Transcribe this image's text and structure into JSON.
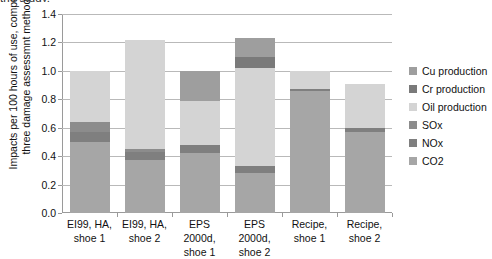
{
  "top_caption": "the study.",
  "chart_data": {
    "type": "bar",
    "subtype": "stacked",
    "title": "",
    "xlabel": "",
    "ylabel": "Impacts per 100 hours of use, comparing three damage assessmnt methods",
    "ylabel_lines": [
      "Impacts per 100 hours of use, comparing",
      "three damage assessmnt methods"
    ],
    "ylim": [
      0.0,
      1.4
    ],
    "yticks": [
      0.0,
      0.2,
      0.4,
      0.6,
      0.8,
      1.0,
      1.2,
      1.4
    ],
    "ytick_labels": [
      "0.0",
      "0.2",
      "0.4",
      "0.6",
      "0.8",
      "1.0",
      "1.2",
      "1.4"
    ],
    "grid": true,
    "legend_position": "right",
    "categories": [
      "EI99, HA, shoe 1",
      "EI99, HA, shoe 2",
      "EPS 2000d, shoe 1",
      "EPS 2000d, shoe 2",
      "Recipe, shoe 1",
      "Recipe, shoe 2"
    ],
    "category_lines": [
      [
        "EI99, HA,",
        "shoe 1"
      ],
      [
        "EI99, HA,",
        "shoe 2"
      ],
      [
        "EPS 2000d,",
        "shoe 1"
      ],
      [
        "EPS 2000d,",
        "shoe 2"
      ],
      [
        "Recipe,",
        "shoe 1"
      ],
      [
        "Recipe,",
        "shoe 2"
      ]
    ],
    "stack_order_bottom_to_top": [
      "CO2",
      "NOx",
      "SOx",
      "Oil production",
      "Cr production",
      "Cu production"
    ],
    "series": [
      {
        "name": "CO2",
        "color": "#a6a6a6",
        "values": [
          0.5,
          0.37,
          0.42,
          0.28,
          0.855,
          0.57
        ]
      },
      {
        "name": "NOx",
        "color": "#7f7f7f",
        "values": [
          0.07,
          0.06,
          0.06,
          0.05,
          0.02,
          0.03
        ]
      },
      {
        "name": "SOx",
        "color": "#8c8c8c",
        "values": [
          0.07,
          0.02,
          0.0,
          0.0,
          0.0,
          0.0
        ]
      },
      {
        "name": "Oil production",
        "color": "#d4d4d4",
        "values": [
          0.36,
          0.77,
          0.31,
          0.69,
          0.125,
          0.305
        ]
      },
      {
        "name": "Cr production",
        "color": "#7a7a7a",
        "values": [
          0.0,
          0.0,
          0.0,
          0.08,
          0.0,
          0.0
        ]
      },
      {
        "name": "Cu production",
        "color": "#9e9e9e",
        "values": [
          0.0,
          0.0,
          0.21,
          0.13,
          0.0,
          0.0
        ]
      }
    ],
    "totals": [
      1.0,
      1.22,
      1.0,
      1.23,
      1.0,
      0.905
    ],
    "legend_entries": [
      {
        "label": "Cu production",
        "color": "#9e9e9e"
      },
      {
        "label": "Cr production",
        "color": "#7a7a7a"
      },
      {
        "label": "Oil production",
        "color": "#d4d4d4"
      },
      {
        "label": "SOx",
        "color": "#8c8c8c"
      },
      {
        "label": "NOx",
        "color": "#7f7f7f"
      },
      {
        "label": "CO2",
        "color": "#a6a6a6"
      }
    ]
  }
}
